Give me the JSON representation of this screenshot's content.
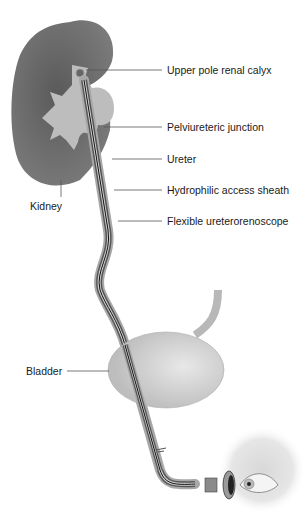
{
  "figure": {
    "labels": {
      "upper_pole": "Upper pole renal calyx",
      "pui_junction": "Pelviureteric junction",
      "ureter": "Ureter",
      "sheath": "Hydrophilic access sheath",
      "scope": "Flexible ureterorenoscope",
      "kidney": "Kidney",
      "bladder": "Bladder"
    },
    "colors": {
      "kidney_cortex": "#6e6e6e",
      "collecting_system": "#bdbdbd",
      "bladder": "#c8c8c8",
      "leader_line": "#555555",
      "text": "#1a1a1a"
    }
  }
}
